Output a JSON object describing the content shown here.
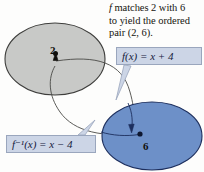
{
  "figure": {
    "name": "inverse-function-mapping-diagram",
    "background_color": "#fdfdfc"
  },
  "caption": {
    "line1_italic": "f",
    "line1_rest": " matches 2 with 6",
    "line2": "to yield the ordered",
    "line3": "pair (2,  6)."
  },
  "labels": {
    "forward": {
      "text": "f(x)  =  x  +  4",
      "fn_name": "f",
      "arg": "(x)",
      "equals": "=",
      "expr": "x  +  4",
      "fill": "#ccd5e6",
      "stroke": "#9aa6bd"
    },
    "inverse": {
      "text": "f⁻¹(x)  =  x  −  4",
      "fn_name": "f",
      "exponent": "−1",
      "arg": "(x)",
      "equals": "=",
      "expr": "x  −  4",
      "fill": "#ccd5e6",
      "stroke": "#9aa6bd"
    }
  },
  "sets": {
    "domain": {
      "label": "domain-ellipse",
      "fill": "#c8c9c7",
      "stroke": "#3e3e3c"
    },
    "range": {
      "label": "range-ellipse",
      "fill": "#6d90c8",
      "stroke": "#1d2f5e"
    }
  },
  "nodes": [
    {
      "value": "2",
      "set": "domain"
    },
    {
      "value": "6",
      "set": "range"
    }
  ],
  "arrows": {
    "forward_color": "#4a4a46",
    "inverse_color": "#1d2f5e"
  }
}
